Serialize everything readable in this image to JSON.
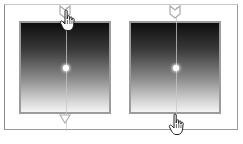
{
  "figure": {
    "panels": [
      {
        "id": "left",
        "gradient": {
          "direction": "top-to-bottom",
          "start_color": "#0e0e0e",
          "end_color": "#f4f4f4"
        },
        "border_color": "#9c9c9c",
        "cursor": {
          "icon": "hand-pointer-icon",
          "position": "top-handle"
        }
      },
      {
        "id": "right",
        "gradient": {
          "direction": "top-to-bottom",
          "start_color": "#0e0e0e",
          "end_color": "#f4f4f4"
        },
        "border_color": "#9c9c9c",
        "cursor": {
          "icon": "hand-pointer-icon",
          "position": "bottom-handle"
        }
      }
    ],
    "handles": {
      "top": "notch-handle-icon",
      "bottom": "triangle-down-handle-icon",
      "center": "center-dot"
    },
    "colors": {
      "frame_border": "#9a9a9a",
      "handle_stroke": "#a8a8a8",
      "axis_line": "#c8c8c8",
      "background": "#ffffff"
    }
  }
}
